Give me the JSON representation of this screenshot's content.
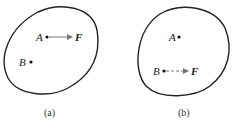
{
  "figures": [
    {
      "caption": "(a)",
      "points": [
        {
          "label": "A",
          "x": 47,
          "y": 37
        },
        {
          "label": "B",
          "x": 31,
          "y": 62
        }
      ],
      "force": {
        "label": "F",
        "from": "A",
        "style": "solid"
      }
    },
    {
      "caption": "(b)",
      "points": [
        {
          "label": "A",
          "x": 179,
          "y": 37
        },
        {
          "label": "B",
          "x": 164,
          "y": 71
        }
      ],
      "force": {
        "label": "F",
        "from": "B",
        "style": "dashed"
      }
    }
  ],
  "colors": {
    "stroke": "#222222",
    "arrow": "#888888"
  }
}
